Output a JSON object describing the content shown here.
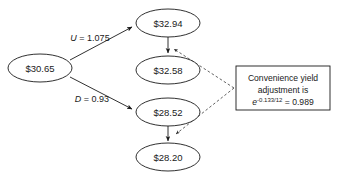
{
  "diagram": {
    "type": "binomial-tree",
    "background_color": "#ffffff",
    "line_color": "#1a1a1a",
    "nodes": [
      {
        "id": "root",
        "label": "$30.65",
        "cx": 40,
        "cy": 68,
        "rx": 32,
        "ry": 14
      },
      {
        "id": "up",
        "label": "$32.94",
        "cx": 168,
        "cy": 23,
        "rx": 32,
        "ry": 14
      },
      {
        "id": "up_adj",
        "label": "$32.58",
        "cx": 168,
        "cy": 70,
        "rx": 32,
        "ry": 14
      },
      {
        "id": "down",
        "label": "$28.52",
        "cx": 168,
        "cy": 112,
        "rx": 32,
        "ry": 14
      },
      {
        "id": "down_adj",
        "label": "$28.20",
        "cx": 168,
        "cy": 157,
        "rx": 32,
        "ry": 14
      }
    ],
    "branches": [
      {
        "id": "up-branch",
        "variable": "U",
        "equals": " = ",
        "value": "1.075",
        "label_x": 90,
        "label_y": 41
      },
      {
        "id": "down-branch",
        "variable": "D",
        "equals": " = ",
        "value": "0.93",
        "label_x": 92,
        "label_y": 102
      }
    ],
    "callout": {
      "line1": "Convenience yield",
      "line2": "adjustment is",
      "formula_base": "e",
      "formula_exponent": "-0.133/12",
      "formula_result": " = 0.989",
      "box": {
        "x": 236,
        "y": 66,
        "width": 94,
        "height": 44
      }
    }
  }
}
